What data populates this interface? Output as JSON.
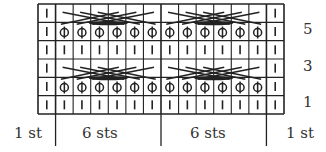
{
  "chart": {
    "type": "knitting-chart",
    "columns": 14,
    "rows": 6,
    "grid": {
      "left": 38,
      "top": 4,
      "right": 284,
      "bottom": 114
    },
    "line_color": "#222222",
    "row_numbers": [
      {
        "row": 5,
        "label": "5"
      },
      {
        "row": 3,
        "label": "3"
      },
      {
        "row": 1,
        "label": "1"
      }
    ],
    "bottom_labels": [
      {
        "id": "left-edge",
        "label": "1 st"
      },
      {
        "id": "repeat-1",
        "label": "6 sts"
      },
      {
        "id": "repeat-2",
        "label": "6 sts"
      },
      {
        "id": "right-edge",
        "label": "1 st"
      }
    ],
    "symbols": {
      "knit": "vertical bar",
      "twisted": "circle with vertical stroke",
      "cable": "crossing diagonal lines"
    },
    "row_pattern": [
      {
        "row": 6,
        "cells": [
          "knit",
          "cable",
          "cable",
          "cable",
          "cable",
          "cable",
          "cable",
          "cable",
          "cable",
          "cable",
          "cable",
          "cable",
          "cable",
          "knit"
        ]
      },
      {
        "row": 5,
        "cells": [
          "knit",
          "twisted",
          "twisted",
          "twisted",
          "twisted",
          "twisted",
          "twisted",
          "twisted",
          "twisted",
          "twisted",
          "twisted",
          "twisted",
          "twisted",
          "knit"
        ]
      },
      {
        "row": 4,
        "cells": [
          "knit",
          "knit",
          "knit",
          "knit",
          "knit",
          "knit",
          "knit",
          "knit",
          "knit",
          "knit",
          "knit",
          "knit",
          "knit",
          "knit"
        ]
      },
      {
        "row": 3,
        "cells": [
          "knit",
          "cable",
          "cable",
          "cable",
          "cable",
          "cable",
          "cable",
          "cable",
          "cable",
          "cable",
          "cable",
          "cable",
          "cable",
          "knit"
        ]
      },
      {
        "row": 2,
        "cells": [
          "knit",
          "twisted",
          "twisted",
          "twisted",
          "twisted",
          "twisted",
          "twisted",
          "twisted",
          "twisted",
          "twisted",
          "twisted",
          "twisted",
          "twisted",
          "knit"
        ]
      },
      {
        "row": 1,
        "cells": [
          "knit",
          "knit",
          "knit",
          "knit",
          "knit",
          "knit",
          "knit",
          "knit",
          "knit",
          "knit",
          "knit",
          "knit",
          "knit",
          "knit"
        ]
      }
    ]
  }
}
